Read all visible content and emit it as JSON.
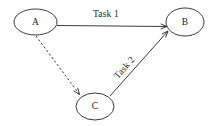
{
  "diagram": {
    "type": "directed-graph",
    "title": "",
    "background_color": "#ffffff",
    "stroke_color": "#3a3a3a",
    "text_color": "#1d1d1d",
    "canvas": {
      "width": 214,
      "height": 126
    },
    "nodes": [
      {
        "id": "A",
        "label": "A",
        "shape": "ellipse",
        "cx": 35.5,
        "cy": 22,
        "rx": 21.5,
        "ry": 13
      },
      {
        "id": "B",
        "label": "B",
        "shape": "ellipse",
        "cx": 185,
        "cy": 22,
        "rx": 19,
        "ry": 14
      },
      {
        "id": "C",
        "label": "C",
        "shape": "ellipse",
        "cx": 95,
        "cy": 106.5,
        "rx": 19,
        "ry": 13.5
      }
    ],
    "edges": [
      {
        "id": "edge-a-b",
        "from": "A",
        "to": "B",
        "label": "Task 1",
        "style": "solid",
        "arrow": true,
        "x1": 57,
        "y1": 25.5,
        "x2": 167,
        "y2": 26.5,
        "label_x": 106,
        "label_y": 15,
        "label_rotation": 0
      },
      {
        "id": "edge-c-b",
        "from": "C",
        "to": "B",
        "label": "Task 2",
        "style": "solid",
        "arrow": true,
        "x1": 110,
        "y1": 96,
        "x2": 168,
        "y2": 31,
        "label_x": 125,
        "label_y": 68,
        "label_rotation": -48
      },
      {
        "id": "edge-a-c",
        "from": "A",
        "to": "C",
        "label": "",
        "style": "dashed",
        "arrow": true,
        "x1": 36,
        "y1": 36,
        "x2": 79.5,
        "y2": 94.5,
        "label_x": 0,
        "label_y": 0,
        "label_rotation": 0
      }
    ]
  }
}
